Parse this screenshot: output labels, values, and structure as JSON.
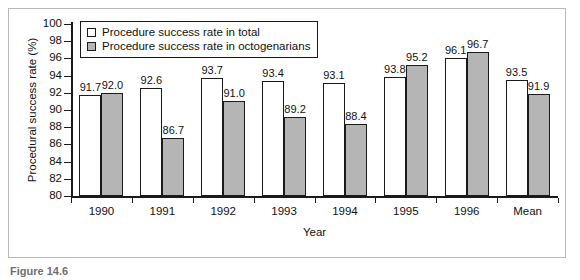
{
  "figure": {
    "caption": "Figure 14.6"
  },
  "legend": {
    "position": "top-left-inside",
    "entries": [
      {
        "label": "Procedure success rate in total",
        "swatch": "white-square-icon",
        "color": "#ffffff"
      },
      {
        "label": "Procedure success rate in octogenarians",
        "swatch": "gray-square-icon",
        "color": "#b5b5b5"
      }
    ]
  },
  "chart_data": {
    "type": "bar",
    "title": "",
    "xlabel": "Year",
    "ylabel": "Procedural success rate (%)",
    "ylim": [
      80,
      100
    ],
    "ytick_step": 2,
    "yticks": [
      80,
      82,
      84,
      86,
      88,
      90,
      92,
      94,
      96,
      98,
      100
    ],
    "grid": false,
    "legend_position": "upper left",
    "categories": [
      "1990",
      "1991",
      "1992",
      "1993",
      "1994",
      "1995",
      "1996",
      "Mean"
    ],
    "series": [
      {
        "name": "Procedure success rate in total",
        "color": "#ffffff",
        "values": [
          91.7,
          92.6,
          93.7,
          93.4,
          93.1,
          93.8,
          96.1,
          93.5
        ],
        "labels": [
          "91.7",
          "92.6",
          "93.7",
          "93.4",
          "93.1",
          "93.8",
          "96.1",
          "93.5"
        ]
      },
      {
        "name": "Procedure success rate in octogenarians",
        "color": "#b5b5b5",
        "values": [
          92.0,
          86.7,
          91.0,
          89.2,
          88.4,
          95.2,
          96.7,
          91.9
        ],
        "labels": [
          "92.0",
          "86.7",
          "91.0",
          "89.2",
          "88.4",
          "95.2",
          "96.7",
          "91.9"
        ]
      }
    ]
  }
}
